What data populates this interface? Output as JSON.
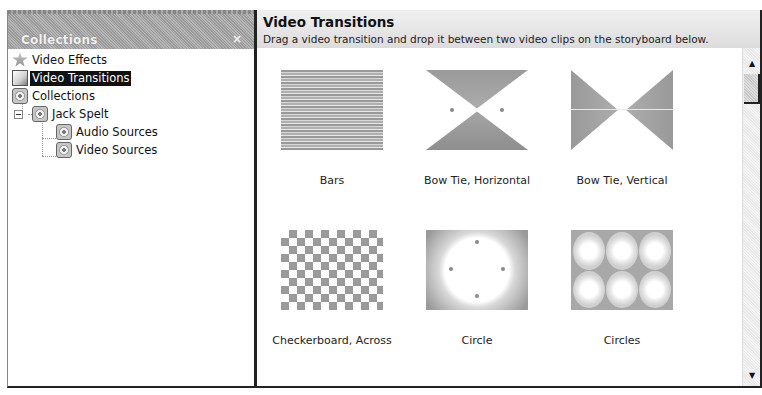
{
  "collections_pane": {
    "title": "Collections",
    "close_label": "×",
    "tree": [
      {
        "label": "Video Effects",
        "icon": "star-icon",
        "level": 0,
        "selected": false
      },
      {
        "label": "Video Transitions",
        "icon": "transition-icon",
        "level": 0,
        "selected": true
      },
      {
        "label": "Collections",
        "icon": "film-reel-icon",
        "level": 0,
        "selected": false
      },
      {
        "label": "Jack Spelt",
        "icon": "film-reel-icon",
        "level": 1,
        "selected": false,
        "expanded": true
      },
      {
        "label": "Audio Sources",
        "icon": "film-reel-icon",
        "level": 2,
        "selected": false
      },
      {
        "label": "Video Sources",
        "icon": "film-reel-icon",
        "level": 2,
        "selected": false
      }
    ]
  },
  "content_pane": {
    "title": "Video Transitions",
    "description": "Drag a video transition and drop it between two video clips on the storyboard below.",
    "transitions": [
      {
        "label": "Bars",
        "thumbnail": "bars"
      },
      {
        "label": "Bow Tie, Horizontal",
        "thumbnail": "bow-tie-horizontal"
      },
      {
        "label": "Bow Tie, Vertical",
        "thumbnail": "bow-tie-vertical"
      },
      {
        "label": "Checkerboard, Across",
        "thumbnail": "checkerboard"
      },
      {
        "label": "Circle",
        "thumbnail": "circle"
      },
      {
        "label": "Circles",
        "thumbnail": "circles"
      }
    ]
  },
  "scrollbar": {
    "up_glyph": "▲",
    "down_glyph": "▼"
  }
}
